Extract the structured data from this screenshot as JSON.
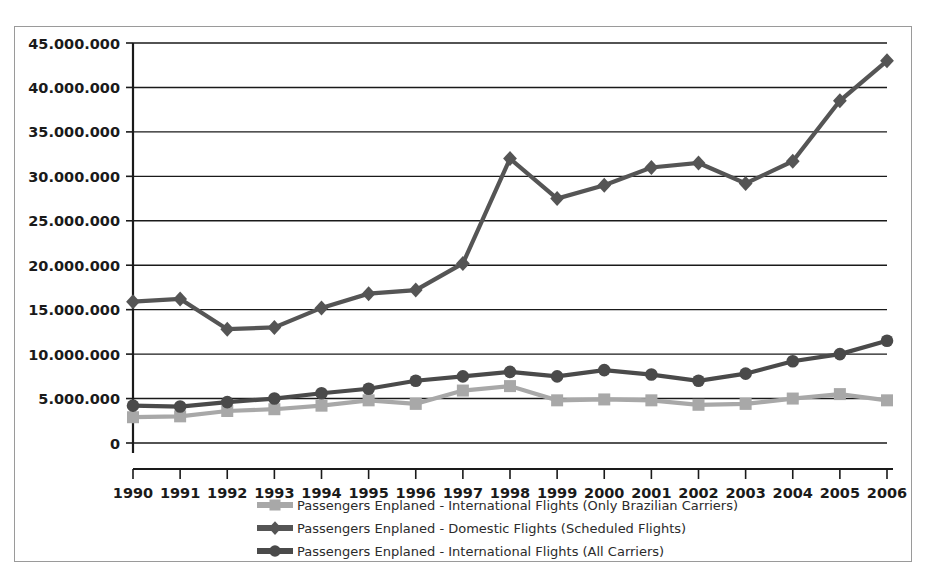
{
  "chart_data": {
    "type": "line",
    "title": "",
    "subtitle": "",
    "xlabel": "",
    "ylabel": "",
    "grid": true,
    "legend_position": "bottom",
    "xlim": [
      1990,
      2006
    ],
    "ylim": [
      0,
      45000000
    ],
    "ytick_step": 5000000,
    "categories": [
      1990,
      1991,
      1992,
      1993,
      1994,
      1995,
      1996,
      1997,
      1998,
      1999,
      2000,
      2001,
      2002,
      2003,
      2004,
      2005,
      2006
    ],
    "x_tick_labels": [
      "1990",
      "1991",
      "1992",
      "1993",
      "1994",
      "1995",
      "1996",
      "1997",
      "1998",
      "1999",
      "2000",
      "2001",
      "2002",
      "2003",
      "2004",
      "2005",
      "2006"
    ],
    "y_tick_labels": [
      "0",
      "5.000.000",
      "10.000.000",
      "15.000.000",
      "20.000.000",
      "25.000.000",
      "30.000.000",
      "35.000.000",
      "40.000.000",
      "45.000.000"
    ],
    "y_tick_values": [
      0,
      5000000,
      10000000,
      15000000,
      20000000,
      25000000,
      30000000,
      35000000,
      40000000,
      45000000
    ],
    "series": [
      {
        "name": "Passengers Enplaned - International Flights (Only Brazilian Carriers)",
        "marker": "square",
        "color": "#a8a8a8",
        "values": [
          2900000,
          3000000,
          3600000,
          3800000,
          4200000,
          4800000,
          4400000,
          5900000,
          6400000,
          4800000,
          4900000,
          4800000,
          4300000,
          4400000,
          5000000,
          5500000,
          4800000
        ]
      },
      {
        "name": "Passengers Enplaned - Domestic Flights (Scheduled Flights)",
        "marker": "diamond",
        "color": "#555555",
        "values": [
          15900000,
          16200000,
          12800000,
          13000000,
          15200000,
          16800000,
          17200000,
          20200000,
          32000000,
          27500000,
          29000000,
          31000000,
          31500000,
          29200000,
          31700000,
          38500000,
          43000000
        ]
      },
      {
        "name": "Passengers Enplaned - International Flights (All Carriers)",
        "marker": "circle",
        "color": "#4a4a4a",
        "values": [
          4200000,
          4100000,
          4600000,
          5000000,
          5600000,
          6100000,
          7000000,
          7500000,
          8000000,
          7500000,
          8200000,
          7700000,
          7000000,
          7800000,
          9200000,
          10000000,
          11500000
        ]
      }
    ]
  },
  "colors": {
    "axis": "#1a1a1a",
    "grid": "#1a1a1a",
    "frame_border": "#9a9a9a",
    "background": "#ffffff",
    "series_brazilian": "#a8a8a8",
    "series_domestic": "#555555",
    "series_international": "#4a4a4a"
  }
}
